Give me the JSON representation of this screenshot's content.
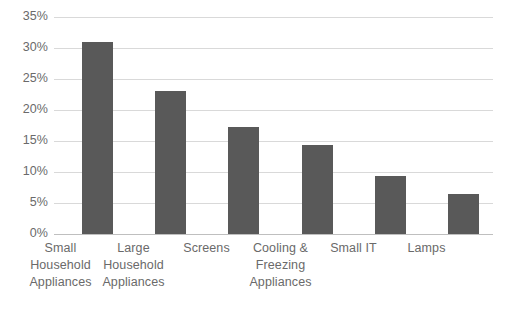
{
  "chart_data": {
    "type": "bar",
    "title": "",
    "subtitle": "",
    "xlabel": "",
    "ylabel": "",
    "categories": [
      "Small Household Appliances",
      "Large Household Appliances",
      "Screens",
      "Cooling & Freezing Appliances",
      "Small IT",
      "Lamps"
    ],
    "category_lines": [
      [
        "Small",
        "Household",
        "Appliances"
      ],
      [
        "Large",
        "Household",
        "Appliances"
      ],
      [
        "Screens"
      ],
      [
        "Cooling &",
        "Freezing",
        "Appliances"
      ],
      [
        "Small IT"
      ],
      [
        "Lamps"
      ]
    ],
    "values": [
      31.0,
      23.0,
      17.2,
      14.3,
      9.3,
      6.5
    ],
    "value_unit": "%",
    "ylim": [
      0,
      35
    ],
    "ytick_values": [
      35,
      30,
      25,
      20,
      15,
      10,
      5,
      0
    ],
    "ytick_labels": [
      "35%",
      "30%",
      "25%",
      "20%",
      "15%",
      "10%",
      "5%",
      "0%"
    ],
    "grid": true,
    "grid_axis": "y",
    "legend": false,
    "legend_position": "none",
    "series": [
      {
        "name": "Share",
        "values": [
          31.0,
          23.0,
          17.2,
          14.3,
          9.3,
          6.5
        ]
      }
    ],
    "colors": {
      "bar": "#595959",
      "gridline": "#d9d9d9",
      "baseline": "#bfbfbf",
      "tick_label": "#6a6a6a",
      "background": "#ffffff"
    }
  }
}
